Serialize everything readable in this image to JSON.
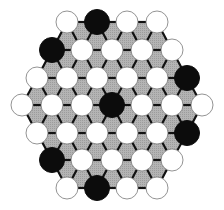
{
  "game": {
    "name": "hex-triangular-board",
    "board_shape": "hexagon",
    "rows": [
      {
        "y": 22,
        "stones": [
          [
            "W",
            67
          ],
          [
            "B",
            97
          ],
          [
            "W",
            127
          ],
          [
            "W",
            157
          ]
        ]
      },
      {
        "y": 50,
        "stones": [
          [
            "B",
            52
          ],
          [
            "W",
            82
          ],
          [
            "W",
            112
          ],
          [
            "W",
            142
          ],
          [
            "W",
            172
          ]
        ]
      },
      {
        "y": 78,
        "stones": [
          [
            "W",
            37
          ],
          [
            "W",
            67
          ],
          [
            "W",
            97
          ],
          [
            "W",
            127
          ],
          [
            "W",
            157
          ],
          [
            "B",
            187
          ]
        ]
      },
      {
        "y": 105,
        "stones": [
          [
            "W",
            22
          ],
          [
            "W",
            52
          ],
          [
            "W",
            82
          ],
          [
            "B",
            112
          ],
          [
            "W",
            142
          ],
          [
            "W",
            172
          ],
          [
            "W",
            202
          ]
        ]
      },
      {
        "y": 133,
        "stones": [
          [
            "W",
            37
          ],
          [
            "W",
            67
          ],
          [
            "W",
            97
          ],
          [
            "W",
            127
          ],
          [
            "W",
            157
          ],
          [
            "B",
            187
          ]
        ]
      },
      {
        "y": 160,
        "stones": [
          [
            "B",
            52
          ],
          [
            "W",
            82
          ],
          [
            "W",
            112
          ],
          [
            "W",
            142
          ],
          [
            "W",
            172
          ]
        ]
      },
      {
        "y": 188,
        "stones": [
          [
            "W",
            67
          ],
          [
            "B",
            97
          ],
          [
            "W",
            127
          ],
          [
            "W",
            157
          ]
        ]
      }
    ],
    "counts": {
      "black": 7,
      "white": 30
    }
  },
  "colors": {
    "board_fill": "#a9a9a9",
    "grid_line": "#111111",
    "black_stone": "#0c0c0c",
    "white_stone": "#ffffff",
    "white_stone_outline": "#777777"
  }
}
